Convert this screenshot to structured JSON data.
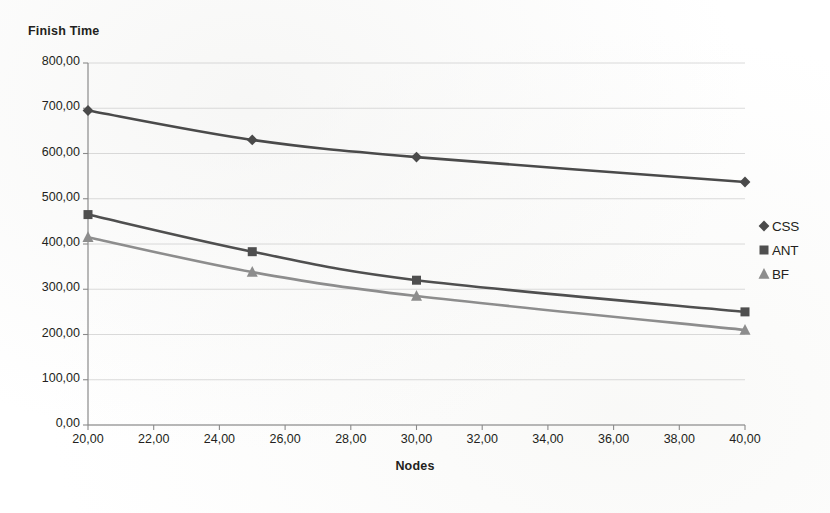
{
  "chart_data": {
    "type": "line",
    "title": "",
    "ylabel": "Finish Time",
    "xlabel": "Nodes",
    "x": [
      20,
      25,
      30,
      40
    ],
    "series": [
      {
        "name": "CSS",
        "marker": "diamond",
        "color": "#4a4a4a",
        "values": [
          695,
          630,
          592,
          537
        ]
      },
      {
        "name": "ANT",
        "marker": "square",
        "color": "#4f4f4f",
        "values": [
          465,
          383,
          320,
          250
        ]
      },
      {
        "name": "BF",
        "marker": "triangle",
        "color": "#8d8d8d",
        "values": [
          415,
          338,
          285,
          210
        ]
      }
    ],
    "xlim": [
      20,
      40
    ],
    "ylim": [
      0,
      800
    ],
    "x_ticks": [
      "20,00",
      "22,00",
      "24,00",
      "26,00",
      "28,00",
      "30,00",
      "32,00",
      "34,00",
      "36,00",
      "38,00",
      "40,00"
    ],
    "x_tick_values": [
      20,
      22,
      24,
      26,
      28,
      30,
      32,
      34,
      36,
      38,
      40
    ],
    "y_ticks": [
      "0,00",
      "100,00",
      "200,00",
      "300,00",
      "400,00",
      "500,00",
      "600,00",
      "700,00",
      "800,00"
    ],
    "y_tick_values": [
      0,
      100,
      200,
      300,
      400,
      500,
      600,
      700,
      800
    ],
    "grid": true,
    "grid_color": "#c8c8c8",
    "axis_color": "#8a8a8a",
    "legend_position": "right"
  },
  "axes": {
    "y_title": "Finish Time",
    "x_title": "Nodes"
  },
  "legend": {
    "items": [
      {
        "label": "CSS",
        "marker": "diamond-marker-icon",
        "color": "#4a4a4a"
      },
      {
        "label": "ANT",
        "marker": "square-marker-icon",
        "color": "#4f4f4f"
      },
      {
        "label": "BF",
        "marker": "triangle-marker-icon",
        "color": "#8d8d8d"
      }
    ]
  }
}
